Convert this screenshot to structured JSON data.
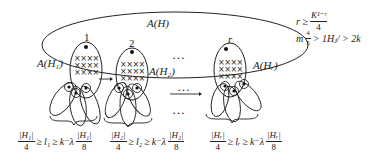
{
  "diagram": {
    "outer_set_label": "A(H)",
    "groups": [
      {
        "index_label": "1",
        "set_label": "A(H₁)",
        "bound": {
          "numerator": "|H₁|",
          "denom1": "4",
          "ell": "l₁",
          "k_exp": "k⁻λ",
          "numerator2": "|H₁|",
          "denom2": "8",
          "ge": "≥"
        }
      },
      {
        "index_label": "2",
        "set_label": "A(H₂)",
        "bound": {
          "numerator": "|H₂|",
          "denom1": "4",
          "ell": "l₂",
          "k_exp": "k⁻λ",
          "numerator2": "|H₂|",
          "denom2": "8",
          "ge": "≥"
        }
      },
      {
        "index_label": "r",
        "set_label": "A(Hᵣ)",
        "bound": {
          "numerator": "|Hᵣ|",
          "denom1": "4",
          "ell": "lᵣ",
          "k_exp": "k⁻λ",
          "numerator2": "|Hᵣ|",
          "denom2": "8",
          "ge": "≥"
        }
      }
    ],
    "ellipsis": "…",
    "cross_rows": [
      "××××",
      "××××",
      "××××"
    ],
    "conditions": {
      "line1_lhs": "r ≥",
      "line1_num": "K¹⁻ʳ",
      "line1_den": "4",
      "line2_prefix": "m",
      "line2_frac_num": "4",
      "line2_frac_den": "5",
      "line2_rest": "> 1Hⱼ/ > 2k"
    }
  }
}
